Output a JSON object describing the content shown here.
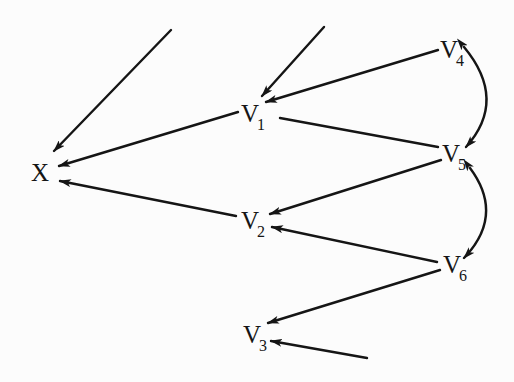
{
  "diagram": {
    "title": "",
    "nodes": [
      {
        "id": "X",
        "label": "X",
        "subscript": ""
      },
      {
        "id": "V1",
        "label": "V",
        "subscript": "1"
      },
      {
        "id": "V2",
        "label": "V",
        "subscript": "2"
      },
      {
        "id": "V3",
        "label": "V",
        "subscript": "3"
      },
      {
        "id": "V4",
        "label": "V",
        "subscript": "4"
      },
      {
        "id": "V5",
        "label": "V",
        "subscript": "5"
      },
      {
        "id": "V6",
        "label": "V",
        "subscript": "6"
      }
    ],
    "edges": [
      {
        "from": "(external)",
        "to": "X",
        "type": "directed"
      },
      {
        "from": "(external)",
        "to": "V1",
        "type": "directed"
      },
      {
        "from": "V4",
        "to": "V1",
        "type": "directed"
      },
      {
        "from": "V1",
        "to": "X",
        "type": "directed"
      },
      {
        "from": "V1",
        "to": "V5",
        "type": "undirected"
      },
      {
        "from": "V5",
        "to": "V2",
        "type": "directed"
      },
      {
        "from": "V2",
        "to": "X",
        "type": "directed"
      },
      {
        "from": "V6",
        "to": "V2",
        "type": "directed"
      },
      {
        "from": "V6",
        "to": "V3",
        "type": "directed"
      },
      {
        "from": "(external)",
        "to": "V3",
        "type": "directed"
      },
      {
        "from": "V4",
        "to": "V5",
        "type": "bidirected-curved"
      },
      {
        "from": "V5",
        "to": "V6",
        "type": "bidirected-curved"
      }
    ],
    "colors": {
      "ink": "#151515",
      "background": "#fcfcfc"
    }
  }
}
